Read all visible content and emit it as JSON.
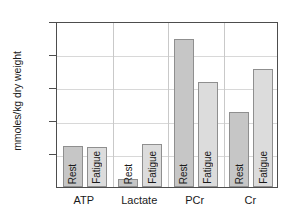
{
  "chart_data": {
    "type": "bar",
    "title": "",
    "xlabel": "",
    "ylabel": "mmoles/kg dry weight",
    "ylim": [
      0,
      100
    ],
    "yticks": [
      20,
      40,
      60,
      80,
      100
    ],
    "ytick_labels": [
      "20",
      "40",
      "60",
      "80",
      "100"
    ],
    "grid": true,
    "legend": "none",
    "categories": [
      "ATP",
      "Lactate",
      "PCr",
      "Cr"
    ],
    "series": [
      {
        "name": "Rest",
        "values": [
          25,
          5,
          89,
          45
        ]
      },
      {
        "name": "Fatigue",
        "values": [
          24,
          26,
          63,
          71
        ]
      }
    ],
    "bars": [
      {
        "category": "ATP",
        "condition": "Rest",
        "value": 25,
        "label": "Rest"
      },
      {
        "category": "ATP",
        "condition": "Fatigue",
        "value": 24,
        "label": "Fatigue"
      },
      {
        "category": "Lactate",
        "condition": "Rest",
        "value": 5,
        "label": "Rest"
      },
      {
        "category": "Lactate",
        "condition": "Fatigue",
        "value": 26,
        "label": "Fatigue"
      },
      {
        "category": "PCr",
        "condition": "Rest",
        "value": 89,
        "label": "Rest"
      },
      {
        "category": "PCr",
        "condition": "Fatigue",
        "value": 63,
        "label": "Fatigue"
      },
      {
        "category": "Cr",
        "condition": "Rest",
        "value": 45,
        "label": "Rest"
      },
      {
        "category": "Cr",
        "condition": "Fatigue",
        "value": 71,
        "label": "Fatigue"
      }
    ],
    "colors": {
      "rest_bar": "#c6c6c6",
      "fatigue_bar": "#dcdcdc",
      "bar_border": "#8f8f8f",
      "axis": "#4d4d4d",
      "gridline": "#d8d8d8",
      "separator": "#c9c9c9",
      "text": "#1a1a1a",
      "background": "#ffffff"
    }
  }
}
